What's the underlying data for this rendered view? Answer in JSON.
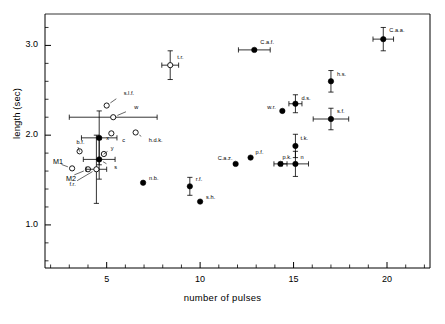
{
  "figure": {
    "type": "scatter",
    "background": "#ffffff",
    "foreground": "#000000"
  },
  "chart_data": {
    "type": "scatter",
    "title": "",
    "subtitle": "",
    "xlabel": "number of pulses",
    "ylabel": "length (sec)",
    "xlim": [
      1.7,
      22.3
    ],
    "ylim": [
      0.52,
      3.35
    ],
    "xticks": [
      5,
      10,
      15,
      20
    ],
    "xtick_labels": [
      "5",
      "10",
      "15",
      "20"
    ],
    "yticks": [
      1.0,
      2.0,
      3.0
    ],
    "ytick_labels": [
      "1.0",
      "2.0",
      "3.0"
    ],
    "minor_ticks": true,
    "grid": false,
    "legend": null,
    "marker_types": {
      "filled": "filled circle (solid data point)",
      "open": "open circle (outlined data point)"
    },
    "points": [
      {
        "label": "t.r.",
        "x": 8.4,
        "y": 2.78,
        "marker": "open",
        "xerr": 0.45,
        "yerr": 0.16,
        "label_dx": 7,
        "label_dy": -7
      },
      {
        "label": "s.l.f.",
        "x": 5.0,
        "y": 2.33,
        "marker": "open",
        "xerr": 0,
        "yerr": 0,
        "label_dx": 17,
        "label_dy": -12,
        "leader": true
      },
      {
        "label": "w",
        "x": 5.35,
        "y": 2.2,
        "marker": "open",
        "xerr": 2.35,
        "yerr": 0,
        "label_dx": 21,
        "label_dy": -9,
        "leader": true
      },
      {
        "label": "c",
        "x": 5.25,
        "y": 2.02,
        "marker": "open",
        "xerr": 0,
        "yerr": 0,
        "label_dx": 11,
        "label_dy": 8,
        "leader": true
      },
      {
        "label": "h.d.k.",
        "x": 6.55,
        "y": 2.03,
        "marker": "open",
        "xerr": 0,
        "yerr": 0,
        "label_dx": 13,
        "label_dy": 9,
        "leader": true
      },
      {
        "label": "x",
        "x": 4.6,
        "y": 1.97,
        "marker": "filled",
        "xerr": 0.95,
        "yerr": 0.3,
        "label_dx": 7,
        "label_dy": 1
      },
      {
        "label": "b.f.",
        "x": 3.55,
        "y": 1.82,
        "marker": "open",
        "xerr": 0,
        "yerr": 0,
        "label_dx": -3,
        "label_dy": -8,
        "leader": true
      },
      {
        "label": "y",
        "x": 4.85,
        "y": 1.79,
        "marker": "open",
        "xerr": 0,
        "yerr": 0,
        "label_dx": 7,
        "label_dy": -5,
        "leader": true
      },
      {
        "label": "s",
        "x": 4.6,
        "y": 1.73,
        "marker": "filled",
        "xerr": 0.85,
        "yerr": 0.22,
        "label_dx": 15,
        "label_dy": 9,
        "leader": true
      },
      {
        "label": "M1",
        "x": 3.15,
        "y": 1.63,
        "marker": "open",
        "xerr": 0,
        "yerr": 0,
        "label_dx": -19,
        "label_dy": -7,
        "leader": true
      },
      {
        "label": "M2",
        "x": 4.0,
        "y": 1.62,
        "marker": "open",
        "xerr": 0,
        "yerr": 0,
        "label_dx": -22,
        "label_dy": 9,
        "leader": true
      },
      {
        "label": "f.r.",
        "x": 4.45,
        "y": 1.62,
        "marker": "open",
        "xerr": 0.55,
        "yerr": 0.38,
        "label_dx": -27,
        "label_dy": 16,
        "leader": true
      },
      {
        "label": "n.b.",
        "x": 6.95,
        "y": 1.47,
        "marker": "filled",
        "xerr": 0,
        "yerr": 0,
        "label_dx": 6,
        "label_dy": -4
      },
      {
        "label": "r.f.",
        "x": 9.45,
        "y": 1.43,
        "marker": "filled",
        "xerr": 0,
        "yerr": 0.1,
        "label_dx": 6,
        "label_dy": -6
      },
      {
        "label": "s.h.",
        "x": 10.0,
        "y": 1.26,
        "marker": "filled",
        "xerr": 0,
        "yerr": 0,
        "label_dx": 6,
        "label_dy": -4
      },
      {
        "label": "C.a.z.",
        "x": 11.9,
        "y": 1.68,
        "marker": "filled",
        "xerr": 0,
        "yerr": 0,
        "label_dx": -18,
        "label_dy": -5
      },
      {
        "label": "p.f.",
        "x": 12.7,
        "y": 1.75,
        "marker": "filled",
        "xerr": 0,
        "yerr": 0,
        "label_dx": 5,
        "label_dy": -5
      },
      {
        "label": "p.k.",
        "x": 14.3,
        "y": 1.68,
        "marker": "filled",
        "xerr": 0.35,
        "yerr": 0,
        "label_dx": 2,
        "label_dy": -6
      },
      {
        "label": "n",
        "x": 15.1,
        "y": 1.68,
        "marker": "filled",
        "xerr": 0.7,
        "yerr": 0.14,
        "label_dx": 5,
        "label_dy": -6
      },
      {
        "label": "t.k.",
        "x": 15.1,
        "y": 1.88,
        "marker": "filled",
        "xerr": 0,
        "yerr": 0.13,
        "label_dx": 5,
        "label_dy": -7
      },
      {
        "label": "w.r.",
        "x": 14.4,
        "y": 2.27,
        "marker": "filled",
        "xerr": 0,
        "yerr": 0,
        "label_dx": -15,
        "label_dy": -3
      },
      {
        "label": "d.s.",
        "x": 15.1,
        "y": 2.35,
        "marker": "filled",
        "xerr": 0.35,
        "yerr": 0.1,
        "label_dx": 6,
        "label_dy": -5
      },
      {
        "label": "s.f.",
        "x": 17.0,
        "y": 2.18,
        "marker": "filled",
        "xerr": 0.95,
        "yerr": 0.12,
        "label_dx": 6,
        "label_dy": -7
      },
      {
        "label": "h.s.",
        "x": 17.0,
        "y": 2.6,
        "marker": "filled",
        "xerr": 0,
        "yerr": 0.12,
        "label_dx": 6,
        "label_dy": -6
      },
      {
        "label": "C.a.f.",
        "x": 12.9,
        "y": 2.95,
        "marker": "filled",
        "xerr": 0.85,
        "yerr": 0,
        "label_dx": 6,
        "label_dy": -7
      },
      {
        "label": "C.a.a.",
        "x": 19.8,
        "y": 3.07,
        "marker": "filled",
        "xerr": 0.55,
        "yerr": 0.13,
        "label_dx": 6,
        "label_dy": -8
      }
    ]
  }
}
